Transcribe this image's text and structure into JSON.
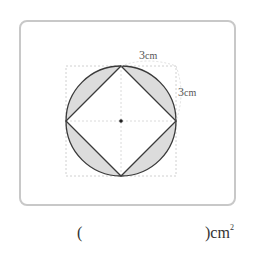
{
  "figure": {
    "labels": {
      "top": {
        "value": "3",
        "unit": "cm"
      },
      "right": {
        "value": "3",
        "unit": "cm"
      }
    },
    "colors": {
      "stroke": "#3a3a3a",
      "shade": "#dcdcdc",
      "guide": "#bfbfbf",
      "frame": "#c8c8c8"
    }
  },
  "answer": {
    "open_paren": "(",
    "close_paren": ")",
    "unit": "cm",
    "exponent": "2"
  }
}
